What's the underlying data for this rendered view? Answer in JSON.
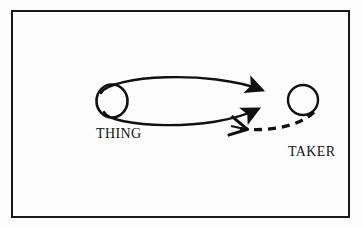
{
  "figure": {
    "kind": "node-link-diagram",
    "background_color": "#fcfcfc",
    "ink_color": "#111111",
    "frame": {
      "name": "figure-border",
      "stroke_color": "#1a1a1a",
      "stroke_width": 2
    }
  },
  "nodes": [
    {
      "id": "thing",
      "label": "THING",
      "shape": "circle",
      "cx": 112,
      "cy": 101,
      "r": 15.5,
      "fill": "none",
      "stroke_color": "#111111",
      "stroke_width": 2.6,
      "label_x": 96,
      "label_y": 127
    },
    {
      "id": "taker",
      "label": "TAKER",
      "shape": "circle",
      "cx": 303,
      "cy": 100,
      "r": 15.0,
      "fill": "none",
      "stroke_color": "#111111",
      "stroke_width": 2.4,
      "label_x": 288,
      "label_y": 145
    }
  ],
  "edges": [
    {
      "id": "edge-top",
      "from": "thing",
      "to": "taker",
      "style": "solid",
      "direction": "thing-to-taker",
      "arrowhead": "filled-triangle",
      "stroke_color": "#111111",
      "stroke_width": 2.4,
      "curve": "arc-above"
    },
    {
      "id": "edge-bottom",
      "from": "thing",
      "to": "taker",
      "style": "solid",
      "direction": "thing-to-taker",
      "arrowhead": "filled-triangle",
      "stroke_color": "#111111",
      "stroke_width": 2.4,
      "curve": "arc-below"
    },
    {
      "id": "edge-dashed",
      "from": "taker",
      "to": "thing",
      "style": "dashed",
      "direction": "taker-to-thing",
      "arrowhead": "open-barb",
      "stroke_color": "#111111",
      "stroke_width": 3.2,
      "dash_pattern": "8 6",
      "dash_segments": 5,
      "curve": "arc-below"
    }
  ]
}
